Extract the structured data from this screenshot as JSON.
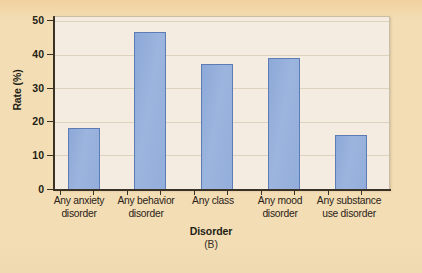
{
  "figure": {
    "panel_letter": "(B)",
    "background_color": "#f3ddb4",
    "plot_background_color": "#f4ece0",
    "bar_fill_color": "#93aedb",
    "bar_stroke_color": "#5d7cb6",
    "axis_color": "#3a3226",
    "gridline_color": "#ded2bd"
  },
  "chart_data": {
    "type": "bar",
    "title": "",
    "subtitle": "(B)",
    "xlabel": "Disorder",
    "ylabel": "Rate (%)",
    "categories": [
      "Any anxiety disorder",
      "Any behavior disorder",
      "Any class",
      "Any mood disorder",
      "Any substance use disorder"
    ],
    "category_lines": [
      [
        "Any anxiety",
        "disorder"
      ],
      [
        "Any behavior",
        "disorder"
      ],
      [
        "Any class",
        ""
      ],
      [
        "Any mood",
        "disorder"
      ],
      [
        "Any substance",
        "use disorder"
      ]
    ],
    "values": [
      17.7,
      45.5,
      36.3,
      38.1,
      15.8
    ],
    "ylim": [
      0,
      50
    ],
    "yticks": [
      0,
      10,
      20,
      30,
      40,
      50
    ],
    "ytick_labels": [
      "0",
      "10",
      "20",
      "30",
      "40",
      "50"
    ],
    "grid": true,
    "grid_axis": "y",
    "legend": false,
    "legend_position": "none",
    "series": [
      {
        "name": "Rate (%)",
        "values": [
          17.7,
          45.5,
          36.3,
          38.1,
          15.8
        ]
      }
    ]
  }
}
